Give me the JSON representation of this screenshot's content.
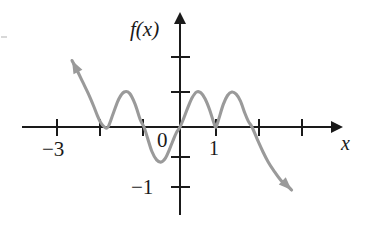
{
  "figure": {
    "labels": {
      "y_axis": "f(x)",
      "x_axis": "x",
      "origin": "0",
      "x_tick_one": "1",
      "x_tick_neg_three": "−3",
      "y_tick_neg_one": "−1"
    },
    "colors": {
      "curve": "#9a9a9a",
      "axis": "#1a1a1a",
      "label": "#1a1a1a",
      "background": "#ffffff"
    }
  },
  "chart_data": {
    "type": "line",
    "title": "",
    "xlabel": "x",
    "ylabel": "f(x)",
    "xlim": [
      -4.1,
      4.2
    ],
    "ylim": [
      -1.5,
      1.25
    ],
    "grid": false,
    "legend": null,
    "x_ticks": [
      -3,
      -2,
      -1,
      0,
      1,
      2,
      3
    ],
    "x_tick_labels": [
      "−3",
      "",
      "",
      "0",
      "1",
      "",
      ""
    ],
    "y_ticks": [
      -1,
      -0.5,
      0.5,
      1
    ],
    "y_tick_labels": [
      "−1",
      "",
      "",
      ""
    ],
    "annotations": [
      {
        "text": "arrow up-left",
        "x": -3.0,
        "y": 0.95
      },
      {
        "text": "arrow down-right",
        "x": 3.1,
        "y": -0.85
      }
    ],
    "series": [
      {
        "name": "f",
        "x": [
          -3.0,
          -2.85,
          -2.7,
          -2.55,
          -2.4,
          -2.3,
          -2.2,
          -2.1,
          -2.0,
          -1.85,
          -1.7,
          -1.55,
          -1.4,
          -1.25,
          -1.1,
          -1.0,
          -0.9,
          -0.78,
          -0.65,
          -0.52,
          -0.4,
          -0.3,
          -0.2,
          -0.1,
          0.0,
          0.1,
          0.22,
          0.34,
          0.46,
          0.58,
          0.7,
          0.82,
          0.94,
          1.0,
          1.08,
          1.2,
          1.32,
          1.44,
          1.56,
          1.68,
          1.8,
          1.9,
          2.0,
          2.15,
          2.3,
          2.45,
          2.6,
          2.8,
          3.0,
          3.1
        ],
        "y": [
          0.95,
          0.8,
          0.64,
          0.48,
          0.3,
          0.17,
          0.06,
          0.0,
          0.0,
          0.2,
          0.4,
          0.5,
          0.48,
          0.33,
          0.1,
          0.0,
          -0.16,
          -0.35,
          -0.47,
          -0.5,
          -0.44,
          -0.33,
          -0.2,
          -0.08,
          0.0,
          0.12,
          0.28,
          0.42,
          0.5,
          0.49,
          0.4,
          0.25,
          0.06,
          0.0,
          0.12,
          0.32,
          0.45,
          0.5,
          0.47,
          0.37,
          0.2,
          0.08,
          0.0,
          -0.18,
          -0.35,
          -0.5,
          -0.62,
          -0.76,
          -0.85,
          -0.9
        ]
      }
    ]
  }
}
